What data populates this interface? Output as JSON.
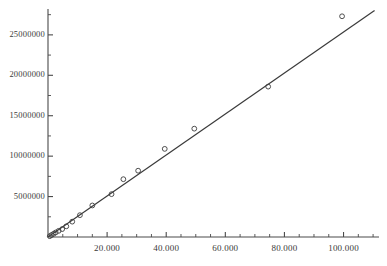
{
  "chart_data": {
    "type": "scatter",
    "title": "",
    "subtitle": "",
    "xlabel": "",
    "ylabel": "",
    "xlim": [
      0,
      112000
    ],
    "ylim": [
      0,
      28200000
    ],
    "grid": false,
    "legend": null,
    "x_tick_labels": [
      "20.000",
      "40.000",
      "60.000",
      "80.000",
      "100.000"
    ],
    "x_tick_values": [
      20000,
      40000,
      60000,
      80000,
      100000
    ],
    "y_tick_labels": [
      "5000000",
      "10000000",
      "15000000",
      "20000000",
      "25000000"
    ],
    "y_tick_values": [
      5000000,
      10000000,
      15000000,
      20000000,
      25000000
    ],
    "x_minor_tick_step": 5000,
    "y_minor_tick_step": 2500000,
    "marker": "open-circle",
    "marker_color": "#3c3c3c",
    "line_color": "#3a3a3a",
    "series": [
      {
        "name": "observations",
        "points": [
          {
            "x": 600,
            "y": 100000
          },
          {
            "x": 1200,
            "y": 250000
          },
          {
            "x": 1900,
            "y": 400000
          },
          {
            "x": 2600,
            "y": 560000
          },
          {
            "x": 3600,
            "y": 760000
          },
          {
            "x": 4800,
            "y": 980000
          },
          {
            "x": 6200,
            "y": 1320000
          },
          {
            "x": 8200,
            "y": 1900000
          },
          {
            "x": 10800,
            "y": 2700000
          },
          {
            "x": 15000,
            "y": 3900000
          },
          {
            "x": 21500,
            "y": 5300000
          },
          {
            "x": 25500,
            "y": 7150000
          },
          {
            "x": 30500,
            "y": 8200000
          },
          {
            "x": 39500,
            "y": 10900000
          },
          {
            "x": 49500,
            "y": 13400000
          },
          {
            "x": 74500,
            "y": 18600000
          },
          {
            "x": 99500,
            "y": 27300000
          }
        ]
      }
    ],
    "fit_line": {
      "name": "fitted line",
      "x_start": 0,
      "y_start": 0,
      "x_end": 110500,
      "y_end": 28000000,
      "slope": 253.4,
      "intercept": 0
    }
  },
  "figure": {
    "background_color": "#ffffff",
    "axis_color": "#4a4a4a"
  }
}
